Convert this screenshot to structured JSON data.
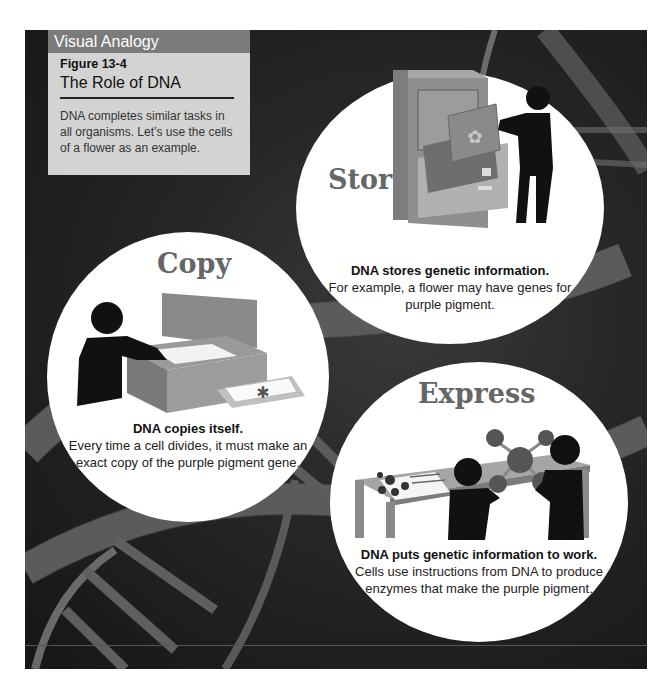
{
  "sidebar_box": {
    "header": "Visual Analogy",
    "figure_number": "Figure 13-4",
    "figure_title": "The Role of DNA",
    "description": "DNA completes similar tasks in all organisms. Let’s use the cells of a flower as an example."
  },
  "panels": {
    "store": {
      "heading": "Store",
      "bold": "DNA stores genetic information.",
      "text": "For example, a flower may have genes for purple pigment.",
      "illustration": "file-cabinet-icon"
    },
    "copy": {
      "heading": "Copy",
      "bold": "DNA copies itself.",
      "text": "Every time a cell divides, it must make an exact copy of the purple pigment gene.",
      "illustration": "copier-icon"
    },
    "express": {
      "heading": "Express",
      "bold": "DNA puts genetic information to work.",
      "text": "Cells use instructions from DNA to produce enzymes that make the purple pigment.",
      "illustration": "molecule-model-icon"
    }
  },
  "colors": {
    "background": "#1e1e1e",
    "header_band": "#7b7b7b",
    "box_body": "#d3d3d3",
    "bubble": "#ffffff",
    "heading_text": "#666666"
  }
}
